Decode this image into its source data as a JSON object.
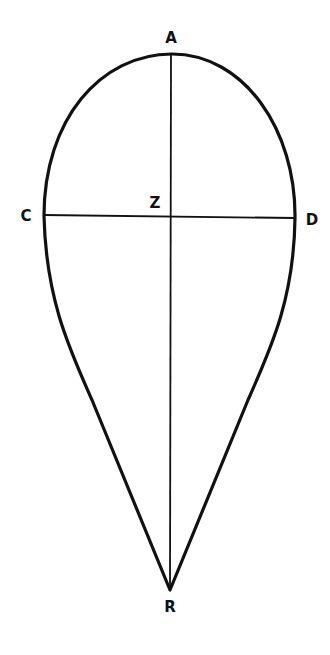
{
  "figure": {
    "stroke_color": "#111111",
    "background": "#ffffff"
  },
  "labels": {
    "A": "A",
    "C": "C",
    "D": "D",
    "Z": "Z",
    "R": "R"
  },
  "points": {
    "A": [
      172,
      54
    ],
    "C": [
      44,
      216
    ],
    "D": [
      295,
      218
    ],
    "Z": [
      170,
      216
    ],
    "R": [
      170,
      590
    ]
  }
}
